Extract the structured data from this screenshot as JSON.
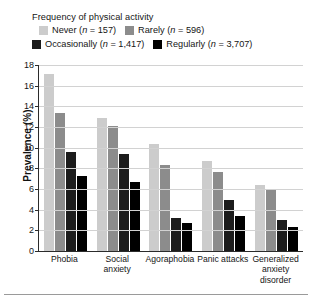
{
  "legend": {
    "title": "Frequency of physical activity",
    "entries": [
      {
        "label": "Never (n = 157)",
        "name": "Never",
        "n": "157",
        "color": "#cccccc"
      },
      {
        "label": "Rarely (n = 596)",
        "name": "Rarely",
        "n": "596",
        "color": "#8c8c8c"
      },
      {
        "label": "Occasionally (n = 1,417)",
        "name": "Occasionally",
        "n": "1,417",
        "color": "#1c1c1c"
      },
      {
        "label": "Regularly (n = 3,707)",
        "name": "Regularly",
        "n": "3,707",
        "color": "#000000"
      }
    ]
  },
  "axis": {
    "ylabel": "Prevalence (%)",
    "yticks": [
      "0",
      "2",
      "4",
      "6",
      "8",
      "10",
      "12",
      "14",
      "16",
      "18"
    ]
  },
  "chart_data": {
    "type": "bar",
    "title": "",
    "xlabel": "",
    "ylabel": "Prevalence (%)",
    "ylim": [
      0,
      18
    ],
    "ytick_step": 2,
    "grid": true,
    "legend_position": "top-left",
    "legend_title": "Frequency of physical activity",
    "categories": [
      "Phobia",
      "Social anxiety",
      "Agoraphobia",
      "Panic attacks",
      "Generalized anxiety disorder"
    ],
    "series": [
      {
        "name": "Never (n = 157)",
        "color": "#cccccc",
        "values": [
          17.1,
          12.9,
          10.4,
          8.7,
          6.4
        ]
      },
      {
        "name": "Rarely (n = 596)",
        "color": "#8c8c8c",
        "values": [
          13.4,
          12.1,
          8.3,
          7.6,
          5.9
        ]
      },
      {
        "name": "Occasionally (n = 1,417)",
        "color": "#1c1c1c",
        "values": [
          9.6,
          9.4,
          3.2,
          4.9,
          3.0
        ]
      },
      {
        "name": "Regularly (n = 3,707)",
        "color": "#000000",
        "values": [
          7.3,
          6.7,
          2.7,
          3.4,
          2.3
        ]
      }
    ]
  }
}
